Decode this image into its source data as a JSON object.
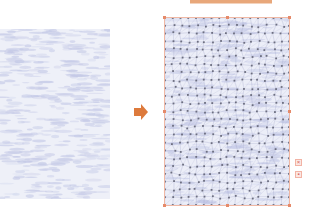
{
  "colors": {
    "accent": "#dd7a3c",
    "frame": "#f0b8a4",
    "vertex": "#6d6f80",
    "texture": "#c3c8e6",
    "texture_bg": "#eef0f8"
  },
  "arrow": {
    "icon": "right-arrow-icon"
  },
  "side_buttons": [
    {
      "name": "delete-mesh-button",
      "icon": "close-icon",
      "glyph": "×"
    },
    {
      "name": "mesh-grid-button",
      "icon": "grid-icon",
      "glyph": "▪"
    }
  ],
  "mesh": {
    "rows": 24,
    "cols": 16
  }
}
